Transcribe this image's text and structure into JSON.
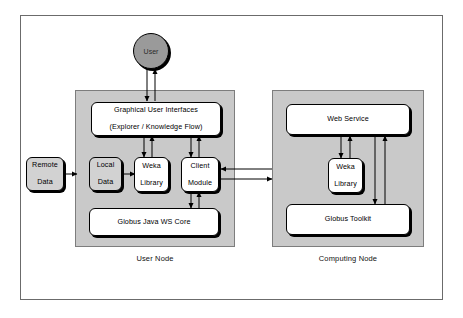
{
  "diagram": {
    "colors": {
      "panel_fill": "#c9c9c9",
      "box_fill": "#ffffff",
      "box_fill_grey": "#d2d2d2",
      "actor_fill": "#9a9a9a",
      "stroke": "#000000",
      "frame": "#6b6b6b"
    },
    "actor": {
      "label": "User"
    },
    "external": {
      "remote_data_label": "Remote\nData",
      "remote_data_line1": "Remote",
      "remote_data_line2": "Data"
    },
    "nodes": [
      {
        "id": "user-node",
        "label": "User Node",
        "boxes": [
          {
            "id": "gui",
            "line1": "Graphical User Interfaces",
            "line2": "(Explorer / Knowledge Flow)"
          },
          {
            "id": "local-data",
            "line1": "Local",
            "line2": "Data"
          },
          {
            "id": "weka-library-client",
            "line1": "Weka",
            "line2": "Library"
          },
          {
            "id": "client-module",
            "line1": "Client",
            "line2": "Module"
          },
          {
            "id": "globus-java-ws-core",
            "line1": "Globus Java WS Core",
            "line2": ""
          }
        ]
      },
      {
        "id": "computing-node",
        "label": "Computing Node",
        "boxes": [
          {
            "id": "web-service",
            "line1": "Web Service",
            "line2": ""
          },
          {
            "id": "weka-library-server",
            "line1": "Weka",
            "line2": "Library"
          },
          {
            "id": "globus-toolkit",
            "line1": "Globus Toolkit",
            "line2": ""
          }
        ]
      }
    ],
    "connections": [
      {
        "from": "gui",
        "to": "user",
        "kind": "bidirectional"
      },
      {
        "from": "remote-data",
        "to": "user-node",
        "kind": "arrow"
      },
      {
        "from": "local-data",
        "to": "weka-library-client",
        "kind": "arrow"
      },
      {
        "from": "gui",
        "to": "weka-library-client",
        "kind": "bidirectional"
      },
      {
        "from": "gui",
        "to": "client-module",
        "kind": "bidirectional"
      },
      {
        "from": "client-module",
        "to": "globus-java-ws-core",
        "kind": "bidirectional"
      },
      {
        "from": "client-module",
        "to": "web-service",
        "kind": "bidirectional"
      },
      {
        "from": "web-service",
        "to": "weka-library-server",
        "kind": "bidirectional"
      },
      {
        "from": "web-service",
        "to": "globus-toolkit",
        "kind": "bidirectional"
      }
    ]
  }
}
